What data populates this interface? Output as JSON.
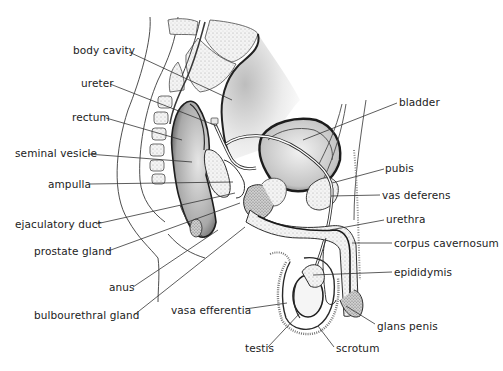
{
  "diagram": {
    "colors": {
      "ink": "#222222",
      "outline": "#3a3a3a",
      "tissue_light": "#efefef",
      "tissue_mid": "#d6d6d6",
      "tissue_dark": "#9a9a9a",
      "background": "#ffffff"
    },
    "labels": [
      {
        "id": "body-cavity",
        "text": "body cavity",
        "x": 73,
        "y": 44,
        "anchor": "left",
        "line": [
          [
            129,
            52
          ],
          [
            232,
            100
          ]
        ]
      },
      {
        "id": "ureter",
        "text": "ureter",
        "x": 81,
        "y": 77,
        "anchor": "left",
        "line": [
          [
            110,
            84
          ],
          [
            217,
            126
          ]
        ]
      },
      {
        "id": "rectum",
        "text": "rectum",
        "x": 72,
        "y": 111,
        "anchor": "left",
        "line": [
          [
            106,
            118
          ],
          [
            182,
            140
          ]
        ]
      },
      {
        "id": "seminal-vesicle",
        "text": "seminal vesicle",
        "x": 15,
        "y": 147,
        "anchor": "left",
        "line": [
          [
            88,
            154
          ],
          [
            192,
            162
          ]
        ]
      },
      {
        "id": "ampulla",
        "text": "ampulla",
        "x": 48,
        "y": 178,
        "anchor": "left",
        "line": [
          [
            90,
            184
          ],
          [
            233,
            182
          ]
        ]
      },
      {
        "id": "ejaculatory-duct",
        "text": "ejaculatory duct",
        "x": 15,
        "y": 218,
        "anchor": "left",
        "line": [
          [
            96,
            224
          ],
          [
            235,
            193
          ]
        ]
      },
      {
        "id": "prostate-gland",
        "text": "prostate gland",
        "x": 34,
        "y": 245,
        "anchor": "left",
        "line": [
          [
            108,
            251
          ],
          [
            240,
            203
          ]
        ]
      },
      {
        "id": "anus",
        "text": "anus",
        "x": 109,
        "y": 281,
        "anchor": "left",
        "line": [
          [
            133,
            287
          ],
          [
            218,
            230
          ]
        ]
      },
      {
        "id": "bulbourethral-gland",
        "text": "bulbourethral gland",
        "x": 34,
        "y": 309,
        "anchor": "left",
        "line": [
          [
            134,
            315
          ],
          [
            245,
            227
          ]
        ]
      },
      {
        "id": "vasa-efferentia",
        "text": "vasa efferentia",
        "x": 171,
        "y": 304,
        "anchor": "left",
        "line": [
          [
            245,
            309
          ],
          [
            287,
            303
          ]
        ]
      },
      {
        "id": "testis",
        "text": "testis",
        "x": 245,
        "y": 342,
        "anchor": "left",
        "line": [
          [
            268,
            347
          ],
          [
            300,
            313
          ]
        ]
      },
      {
        "id": "scrotum",
        "text": "scrotum",
        "x": 336,
        "y": 342,
        "anchor": "left",
        "line": [
          [
            334,
            347
          ],
          [
            318,
            326
          ]
        ]
      },
      {
        "id": "bladder",
        "text": "bladder",
        "x": 399,
        "y": 96,
        "anchor": "left",
        "line": [
          [
            397,
            103
          ],
          [
            303,
            140
          ]
        ]
      },
      {
        "id": "pubis",
        "text": "pubis",
        "x": 385,
        "y": 162,
        "anchor": "left",
        "line": [
          [
            384,
            169
          ],
          [
            332,
            183
          ]
        ]
      },
      {
        "id": "vas-deferens",
        "text": "vas deferens",
        "x": 382,
        "y": 189,
        "anchor": "left",
        "line": [
          [
            380,
            195
          ],
          [
            331,
            196
          ]
        ]
      },
      {
        "id": "urethra",
        "text": "urethra",
        "x": 386,
        "y": 213,
        "anchor": "left",
        "line": [
          [
            384,
            220
          ],
          [
            330,
            230
          ]
        ]
      },
      {
        "id": "corpus-cavernosum",
        "text": "corpus cavernosum",
        "x": 394,
        "y": 237,
        "anchor": "left",
        "line": [
          [
            392,
            243
          ],
          [
            352,
            243
          ]
        ]
      },
      {
        "id": "epididymis",
        "text": "epididymis",
        "x": 394,
        "y": 266,
        "anchor": "left",
        "line": [
          [
            392,
            272
          ],
          [
            313,
            275
          ]
        ]
      },
      {
        "id": "glans-penis",
        "text": "glans penis",
        "x": 377,
        "y": 320,
        "anchor": "left",
        "line": [
          [
            375,
            324
          ],
          [
            346,
            306
          ]
        ]
      }
    ]
  }
}
